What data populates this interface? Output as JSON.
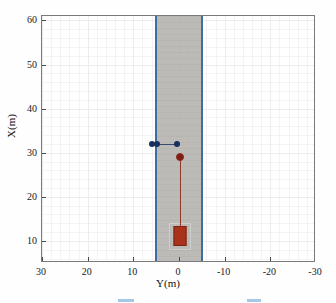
{
  "chart_data": {
    "type": "scatter",
    "title": "",
    "xlabel": "Y(m)",
    "ylabel": "X(m)",
    "xlim": [
      30,
      -30
    ],
    "ylim": [
      5,
      61
    ],
    "x_ticks": [
      30,
      20,
      10,
      0,
      -10,
      -20,
      -30
    ],
    "x_tick_labels": [
      "30",
      "20",
      "10",
      "0",
      "-10",
      "-20",
      "-30"
    ],
    "y_ticks": [
      10,
      20,
      30,
      40,
      50,
      60
    ],
    "y_tick_labels": [
      "10",
      "20",
      "30",
      "40",
      "50",
      "60"
    ],
    "grid": true,
    "legend": "",
    "axis_note": "Y axis (horizontal) is reversed: positive left, negative right",
    "regions": [
      {
        "name": "lane-corridor",
        "fill": "#b4b2ae",
        "edge_color": "#3b6ea5",
        "y_from": 5,
        "y_to": -5,
        "x_from": 5,
        "x_to": 61
      }
    ],
    "series": [
      {
        "name": "detected-objects",
        "marker": "o",
        "color": "#18305c",
        "points": [
          {
            "y": 6.0,
            "x": 32.0
          },
          {
            "y": 4.8,
            "x": 32.0
          },
          {
            "y": 0.5,
            "x": 32.0
          }
        ]
      },
      {
        "name": "tracked-target",
        "marker": "o",
        "color": "#7f1f14",
        "points": [
          {
            "y": -0.2,
            "x": 29.0
          }
        ]
      }
    ],
    "lines": [
      {
        "name": "object-link-line",
        "color": "#3a4a6b",
        "from": {
          "y": 4.8,
          "x": 32.0
        },
        "to": {
          "y": 0.5,
          "x": 32.0
        }
      },
      {
        "name": "track-history-line",
        "color": "#8d3a28",
        "from": {
          "y": -0.2,
          "x": 29.0
        },
        "to": {
          "y": -0.2,
          "x": 13.2
        }
      }
    ],
    "shapes": [
      {
        "name": "ego-vehicle",
        "type": "rectangle",
        "fill": "#a9321a",
        "edge": "#7e2512",
        "center_y": -0.2,
        "center_x": 11.3,
        "width_y": 2.4,
        "height_x": 4.2
      },
      {
        "name": "ego-vehicle-bounding-box",
        "type": "rectangle",
        "fill": "none",
        "edge": "#cfcfcf",
        "center_y": -0.2,
        "center_x": 11.3,
        "width_y": 4.4,
        "height_x": 5.6
      }
    ]
  },
  "axis": {
    "xlabel": "Y(m)",
    "ylabel": "X(m)"
  },
  "legend_sliver": {
    "label_left": "",
    "label_right": ""
  }
}
